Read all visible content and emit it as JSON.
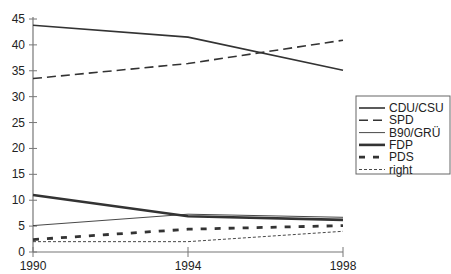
{
  "chart_data": {
    "type": "line",
    "title": "",
    "xlabel": "",
    "ylabel": "",
    "x": [
      "1990",
      "1994",
      "1998"
    ],
    "ylim": [
      0,
      45
    ],
    "yticks": [
      "0",
      "5",
      "10",
      "15",
      "20",
      "25",
      "30",
      "35",
      "40",
      "45"
    ],
    "grid": false,
    "legend_position": "right",
    "series": [
      {
        "name": "CDU/CSU",
        "values": [
          43.8,
          41.5,
          35.1
        ],
        "style": "solid-medium"
      },
      {
        "name": "SPD",
        "values": [
          33.5,
          36.4,
          40.9
        ],
        "style": "dashed-long"
      },
      {
        "name": "B90/GRÜ",
        "values": [
          5.1,
          7.3,
          6.7
        ],
        "style": "solid-thin"
      },
      {
        "name": "FDP",
        "values": [
          11.0,
          6.9,
          6.2
        ],
        "style": "solid-thick"
      },
      {
        "name": "PDS",
        "values": [
          2.4,
          4.4,
          5.1
        ],
        "style": "dashed-thick"
      },
      {
        "name": "right",
        "values": [
          2.0,
          2.0,
          4.0
        ],
        "style": "dotted-thin"
      }
    ]
  },
  "legend": {
    "items": [
      "CDU/CSU",
      "SPD",
      "B90/GRÜ",
      "FDP",
      "PDS",
      "right"
    ]
  }
}
